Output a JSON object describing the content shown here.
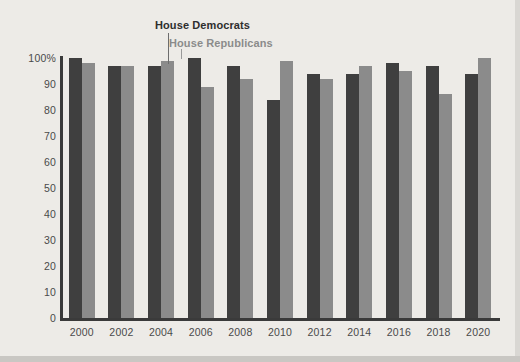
{
  "chart_data": {
    "type": "bar",
    "title": "",
    "subtitle": "",
    "xlabel": "",
    "ylabel": "",
    "ylim": [
      0,
      100
    ],
    "grid": false,
    "legend_position": "inline-annotation",
    "categories": [
      "2000",
      "2002",
      "2004",
      "2006",
      "2008",
      "2010",
      "2012",
      "2014",
      "2016",
      "2018",
      "2020"
    ],
    "series": [
      {
        "name": "House Democrats",
        "color": "#3f3f3f",
        "values": [
          100,
          97,
          97,
          100,
          97,
          84,
          94,
          94,
          98,
          97,
          94
        ]
      },
      {
        "name": "House Republicans",
        "color": "#8b8b8b",
        "values": [
          98,
          97,
          99,
          89,
          92,
          99,
          92,
          97,
          95,
          86,
          100
        ]
      }
    ],
    "y_ticks": [
      "100%",
      "90",
      "80",
      "70",
      "60",
      "50",
      "40",
      "30",
      "20",
      "10",
      "0"
    ],
    "y_tick_values": [
      100,
      90,
      80,
      70,
      60,
      50,
      40,
      30,
      20,
      10,
      0
    ],
    "annotations": [
      {
        "text": "House Democrats",
        "target_series": "House Democrats",
        "target_category": "2004"
      },
      {
        "text": "House Republicans",
        "target_series": "House Republicans",
        "target_category": "2004"
      }
    ]
  },
  "colors": {
    "background": "#edebe7",
    "axis": "#3a3a3a",
    "tick_text": "#4a4a4a",
    "democrats": "#3f3f3f",
    "republicans": "#8b8b8b"
  }
}
